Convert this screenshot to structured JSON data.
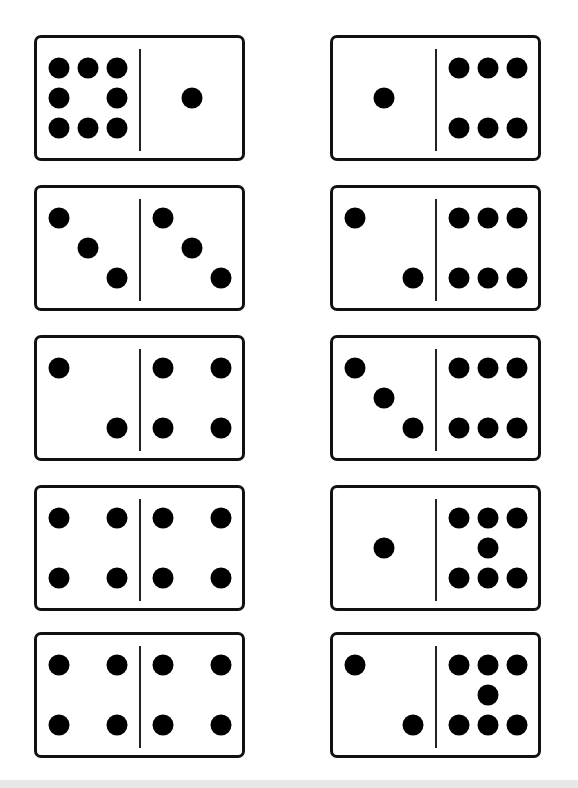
{
  "worksheet": {
    "dominoes": [
      {
        "row": 1,
        "column": "left",
        "left": 9,
        "right": 1,
        "left_layout": [
          "tl",
          "tc",
          "tr",
          "ml",
          "mr",
          "bl",
          "bc",
          "br"
        ],
        "right_layout": [
          "mc"
        ]
      },
      {
        "row": 1,
        "column": "right",
        "left": 1,
        "right": 6,
        "left_layout": [
          "mc"
        ],
        "right_layout": [
          "tl",
          "tc",
          "tr",
          "bl",
          "bc",
          "br"
        ]
      },
      {
        "row": 2,
        "column": "left",
        "left": 3,
        "right": 3,
        "left_layout": [
          "tl",
          "mc",
          "br"
        ],
        "right_layout": [
          "tl",
          "mc",
          "br"
        ]
      },
      {
        "row": 2,
        "column": "right",
        "left": 2,
        "right": 6,
        "left_layout": [
          "tl",
          "br"
        ],
        "right_layout": [
          "tl",
          "tc",
          "tr",
          "bl",
          "bc",
          "br"
        ]
      },
      {
        "row": 3,
        "column": "left",
        "left": 2,
        "right": 4,
        "left_layout": [
          "tl",
          "br"
        ],
        "right_layout": [
          "tl",
          "tr",
          "bl",
          "br"
        ]
      },
      {
        "row": 3,
        "column": "right",
        "left": 3,
        "right": 6,
        "left_layout": [
          "tl",
          "mc",
          "br"
        ],
        "right_layout": [
          "tl",
          "tc",
          "tr",
          "bl",
          "bc",
          "br"
        ]
      },
      {
        "row": 4,
        "column": "left",
        "left": 4,
        "right": 4,
        "left_layout": [
          "tl",
          "tr",
          "bl",
          "br"
        ],
        "right_layout": [
          "tl",
          "tr",
          "bl",
          "br"
        ]
      },
      {
        "row": 4,
        "column": "right",
        "left": 1,
        "right": 7,
        "left_layout": [
          "mc"
        ],
        "right_layout": [
          "tl",
          "tc",
          "tr",
          "mc",
          "bl",
          "bc",
          "br"
        ]
      },
      {
        "row": 5,
        "column": "left",
        "left": 4,
        "right": 4,
        "left_layout": [
          "tl",
          "tr",
          "bl",
          "br"
        ],
        "right_layout": [
          "tl",
          "tr",
          "bl",
          "br"
        ]
      },
      {
        "row": 5,
        "column": "right",
        "left": 2,
        "right": 7,
        "left_layout": [
          "tl",
          "br"
        ],
        "right_layout": [
          "tl",
          "tc",
          "tr",
          "mc",
          "bl",
          "bc",
          "br"
        ]
      }
    ]
  }
}
